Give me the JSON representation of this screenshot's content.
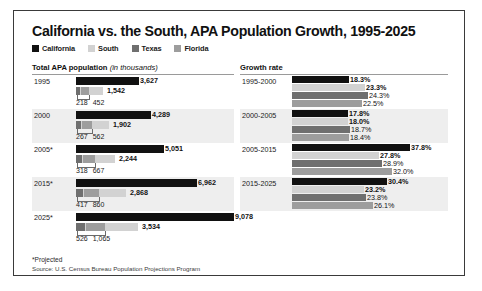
{
  "title": "California vs. the South, APA Population Growth, 1995-2025",
  "legend": [
    {
      "label": "California",
      "color": "#111111"
    },
    {
      "label": "South",
      "color": "#d2d2d2"
    },
    {
      "label": "Texas",
      "color": "#6f6f6f"
    },
    {
      "label": "Florida",
      "color": "#9d9d9d"
    }
  ],
  "panels": {
    "left": {
      "heading": "Total APA population",
      "heading_note": "(in thousands)"
    },
    "right": {
      "heading": "Growth rate"
    }
  },
  "footnote": "*Projected",
  "source": "Source: U.S. Census Bureau Population Projections Program",
  "chart_data": [
    {
      "type": "bar",
      "title": "Total APA population (in thousands)",
      "orientation": "horizontal",
      "categories": [
        "1995",
        "2000",
        "2005*",
        "2015*",
        "2025*"
      ],
      "series": [
        {
          "name": "California",
          "values": [
            3627,
            4289,
            5051,
            6962,
            9078
          ],
          "labels": [
            "3,627",
            "4,289",
            "5,051",
            "6,962",
            "9,078"
          ],
          "color": "#111111"
        },
        {
          "name": "South",
          "values": [
            1542,
            1902,
            2244,
            2868,
            3534
          ],
          "labels": [
            "1,542",
            "1,902",
            "2,244",
            "2,868",
            "3,534"
          ],
          "color": "#d2d2d2"
        },
        {
          "name": "Texas",
          "values": [
            218,
            267,
            318,
            417,
            526
          ],
          "labels": [
            "218",
            "267",
            "318",
            "417",
            "526"
          ],
          "color": "#6f6f6f"
        },
        {
          "name": "Florida",
          "values": [
            452,
            562,
            667,
            860,
            1065
          ],
          "labels": [
            "452",
            "562",
            "667",
            "860",
            "1,065"
          ],
          "color": "#9d9d9d"
        }
      ],
      "xlabel": "",
      "ylabel": "",
      "xlim": [
        0,
        9078
      ],
      "grid": false,
      "legend_position": "top"
    },
    {
      "type": "bar",
      "title": "Growth rate",
      "orientation": "horizontal",
      "categories": [
        "1995-2000",
        "2000-2005",
        "2005-2015",
        "2015-2025"
      ],
      "series": [
        {
          "name": "California",
          "values": [
            18.3,
            17.8,
            37.8,
            30.4
          ],
          "labels": [
            "18.3%",
            "17.8%",
            "37.8%",
            "30.4%"
          ],
          "color": "#111111"
        },
        {
          "name": "South",
          "values": [
            23.3,
            18.0,
            27.8,
            23.2
          ],
          "labels": [
            "23.3%",
            "18.0%",
            "27.8%",
            "23.2%"
          ],
          "color": "#d2d2d2"
        },
        {
          "name": "Texas",
          "values": [
            24.3,
            18.7,
            28.9,
            23.8
          ],
          "labels": [
            "24.3%",
            "18.7%",
            "28.9%",
            "23.8%"
          ],
          "color": "#6f6f6f"
        },
        {
          "name": "Florida",
          "values": [
            22.5,
            18.4,
            32.0,
            26.1
          ],
          "labels": [
            "22.5%",
            "18.4%",
            "32.0%",
            "26.1%"
          ],
          "color": "#9d9d9d"
        }
      ],
      "xlabel": "",
      "ylabel": "",
      "xlim": [
        0,
        37.8
      ],
      "grid": false,
      "legend_position": "top"
    }
  ]
}
